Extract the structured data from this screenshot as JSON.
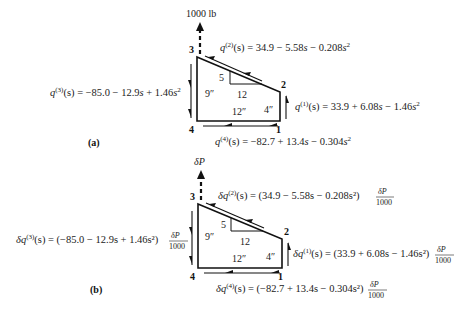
{
  "panel_a": {
    "label": "(a)",
    "load": "1000 lb",
    "nodes": {
      "n1": "1",
      "n2": "2",
      "n3": "3",
      "n4": "4"
    },
    "dims": {
      "left": "9″",
      "bottom": "12″",
      "right": "4″",
      "slope_rise": "5",
      "slope_run": "12"
    },
    "flows": {
      "q2": {
        "lhs_q": "q",
        "lhs_sup": "(2)",
        "lhs_arg": "(s) = 34.9 − 5.58",
        "s1": "s",
        "mid": " − 0.208",
        "s2": "s",
        "exp": "2"
      },
      "q3": {
        "lhs_q": "q",
        "lhs_sup": "(3)",
        "lhs_arg": "(s) = −85.0 − 12.9",
        "s1": "s",
        "mid": " + 1.46",
        "s2": "s",
        "exp": "2"
      },
      "q1": {
        "lhs_q": "q",
        "lhs_sup": "(1)",
        "lhs_arg": "(s) = 33.9 + 6.08",
        "s1": "s",
        "mid": " − 1.46",
        "s2": "s",
        "exp": "2"
      },
      "q4": {
        "lhs_q": "q",
        "lhs_sup": "(4)",
        "lhs_arg": "(s) = −82.7 + 13.4",
        "s1": "s",
        "mid": " − 0.304",
        "s2": "s",
        "exp": "2"
      }
    }
  },
  "panel_b": {
    "label": "(b)",
    "load": "δP",
    "nodes": {
      "n1": "1",
      "n2": "2",
      "n3": "3",
      "n4": "4"
    },
    "dims": {
      "left": "9″",
      "bottom": "12″",
      "right": "4″",
      "slope_rise": "5",
      "slope_run": "12"
    },
    "factor_num": "δP",
    "factor_den": "1000",
    "flows": {
      "q2": {
        "lhs": "δq",
        "sup": "(2)",
        "body": "(s) = (34.9 − 5.58s − 0.208s²)"
      },
      "q3": {
        "lhs": "δq",
        "sup": "(3)",
        "body": "(s) = (−85.0 − 12.9s + 1.46s²)"
      },
      "q1": {
        "lhs": "δq",
        "sup": "(1)",
        "body": "(s) = (33.9 + 6.08s − 1.46s²)"
      },
      "q4": {
        "lhs": "δq",
        "sup": "(4)",
        "body": "(s) = (−82.7 + 13.4s − 0.304s²)"
      }
    }
  }
}
